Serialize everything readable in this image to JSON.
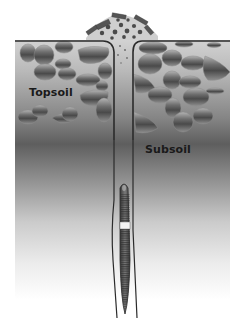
{
  "diagram": {
    "labels": {
      "topsoil": "Topsoil",
      "subsoil": "Subsoil"
    },
    "layers": [
      {
        "name": "Topsoil",
        "description": "Upper layer with many stones/aggregates"
      },
      {
        "name": "Subsoil",
        "description": "Lower layer, gradient fading toward bottom"
      }
    ],
    "elements": [
      {
        "name": "surface-cast-mound",
        "description": "Pile of debris/casts at burrow opening on surface"
      },
      {
        "name": "vertical-burrow",
        "description": "Narrow vertical tunnel extending from surface into subsoil"
      },
      {
        "name": "earthworm",
        "description": "Segmented earthworm inside burrow with pale clitellum band"
      }
    ],
    "colors": {
      "surface_line": "#2b2b2b",
      "soil_light": "#c9c9c9",
      "soil_dark": "#5a5a5a",
      "background": "#ffffff",
      "stone_dark": "#4a4a4a",
      "stone_light": "#9a9a9a"
    }
  }
}
